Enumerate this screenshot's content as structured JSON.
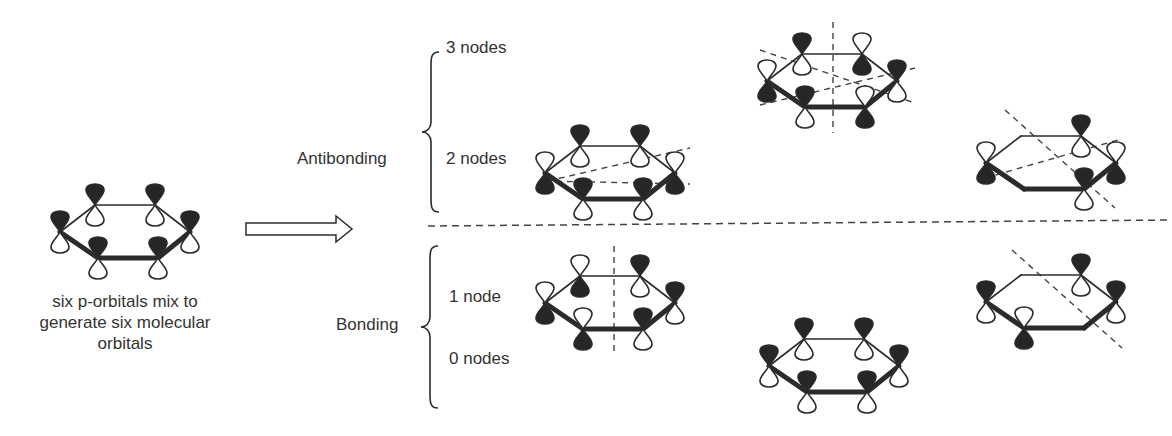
{
  "diagram": {
    "caption_lines": [
      "six p-orbitals mix to",
      "generate six molecular",
      "orbitals"
    ],
    "groups": [
      {
        "label": "Antibonding",
        "levels": [
          "3 nodes",
          "2 nodes"
        ]
      },
      {
        "label": "Bonding",
        "levels": [
          "1 node",
          "0 nodes"
        ]
      }
    ],
    "colors": {
      "ink": "#2b2b2b",
      "lobe_filled": "#262626",
      "lobe_empty": "#ffffff",
      "node_line": "#444444"
    },
    "orbitals": [
      {
        "id": "reference",
        "cx": 127,
        "cy": 232,
        "scale": 1.0,
        "phases": [
          1,
          1,
          1,
          1,
          1,
          1
        ],
        "nodes": []
      },
      {
        "id": "anti-2-nodes-a",
        "cx": 612,
        "cy": 173,
        "scale": 1.0,
        "phases": [
          -1,
          1,
          1,
          -1,
          1,
          1
        ],
        "nodes": [
          [
            545,
            181,
            690,
            184
          ],
          [
            548,
            181,
            690,
            148
          ]
        ]
      },
      {
        "id": "anti-3-nodes",
        "cx": 834,
        "cy": 81,
        "scale": 1.0,
        "phases": [
          -1,
          1,
          -1,
          1,
          -1,
          1
        ],
        "nodes": [
          [
            833,
            22,
            833,
            133
          ],
          [
            760,
            50,
            915,
            103
          ],
          [
            760,
            105,
            915,
            68
          ]
        ]
      },
      {
        "id": "anti-2-nodes-b",
        "cx": 1053,
        "cy": 163,
        "scale": 1.0,
        "phases": [
          -1,
          0,
          1,
          -1,
          1,
          0
        ],
        "nodes": [
          [
            1005,
            110,
            1115,
            208
          ],
          [
            985,
            178,
            1118,
            140
          ]
        ]
      },
      {
        "id": "bond-1-node-a",
        "cx": 612,
        "cy": 303,
        "scale": 1.0,
        "phases": [
          -1,
          -1,
          1,
          1,
          1,
          -1
        ],
        "nodes": [
          [
            614,
            246,
            614,
            353
          ]
        ]
      },
      {
        "id": "bond-0-nodes",
        "cx": 836,
        "cy": 366,
        "scale": 1.0,
        "phases": [
          1,
          1,
          1,
          1,
          1,
          1
        ],
        "nodes": []
      },
      {
        "id": "bond-1-node-b",
        "cx": 1053,
        "cy": 302,
        "scale": 1.0,
        "phases": [
          1,
          0,
          1,
          1,
          0,
          -1
        ],
        "nodes": [
          [
            1012,
            250,
            1122,
            348
          ]
        ]
      }
    ],
    "arrow": {
      "x1": 246,
      "y1": 229,
      "x2": 352,
      "y2": 229
    },
    "divider": {
      "x1": 428,
      "y1": 226,
      "x2": 1172,
      "y2": 220
    }
  }
}
